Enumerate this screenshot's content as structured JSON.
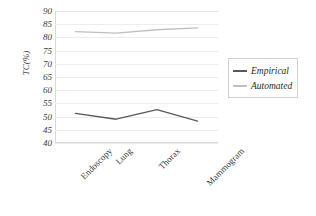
{
  "chart_data": {
    "type": "line",
    "title": "",
    "xlabel": "",
    "ylabel": "TC(%)",
    "categories": [
      "Endoscopy",
      "Lung",
      "Thorax",
      "Mammogram"
    ],
    "ylim": [
      40,
      90
    ],
    "ytick_step": 5,
    "yticks": [
      90,
      85,
      80,
      75,
      70,
      65,
      60,
      55,
      50,
      45,
      40
    ],
    "grid": true,
    "legend_position": "right",
    "series": [
      {
        "name": "Empirical",
        "color": "#595959",
        "values": [
          51.2,
          49.0,
          52.6,
          48.3
        ]
      },
      {
        "name": "Automated",
        "color": "#bfbfbf",
        "values": [
          82.2,
          81.6,
          82.9,
          83.6
        ]
      }
    ]
  }
}
